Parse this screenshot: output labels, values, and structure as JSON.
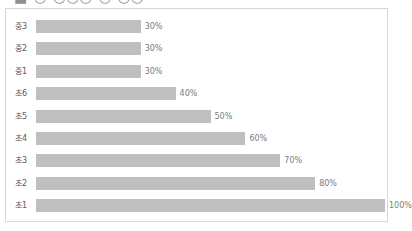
{
  "heading": {
    "cropped_text": "■ ○ ○○○ ○ ○○"
  },
  "colors": {
    "bar": "#bfbfbf",
    "frame_border": "#d7d7d7",
    "label_text": "#5a5a5a",
    "value_text": "#7a7a7a",
    "background": "#ffffff"
  },
  "chart_data": {
    "type": "bar",
    "orientation": "horizontal",
    "title": "",
    "xlabel": "",
    "ylabel": "",
    "xlim": [
      0,
      100
    ],
    "grid": false,
    "legend": "none",
    "value_suffix": "%",
    "categories": [
      "중3",
      "중2",
      "중1",
      "초6",
      "초5",
      "초4",
      "초3",
      "초2",
      "초1"
    ],
    "values": [
      30,
      30,
      30,
      40,
      50,
      60,
      70,
      80,
      100
    ],
    "labels": [
      "30%",
      "30%",
      "30%",
      "40%",
      "50%",
      "60%",
      "70%",
      "80%",
      "100%"
    ]
  }
}
